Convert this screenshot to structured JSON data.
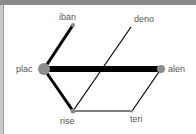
{
  "diagram": {
    "type": "network-graph",
    "nodes": [
      {
        "id": "iban",
        "label": "iban",
        "x": 73,
        "y": 25,
        "r": 2
      },
      {
        "id": "deno",
        "label": "deno",
        "x": 131,
        "y": 27,
        "r": 0
      },
      {
        "id": "plac",
        "label": "plac",
        "x": 44,
        "y": 69,
        "r": 6
      },
      {
        "id": "alen",
        "label": "alen",
        "x": 161,
        "y": 69,
        "r": 4
      },
      {
        "id": "rise",
        "label": "rise",
        "x": 73,
        "y": 111,
        "r": 2.5
      },
      {
        "id": "teri",
        "label": "teri",
        "x": 132,
        "y": 111,
        "r": 1.5
      }
    ],
    "edges": [
      {
        "from": "plac",
        "to": "alen",
        "width": 6
      },
      {
        "from": "plac",
        "to": "iban",
        "width": 3
      },
      {
        "from": "plac",
        "to": "rise",
        "width": 3
      },
      {
        "from": "rise",
        "to": "deno",
        "width": 1.2
      },
      {
        "from": "rise",
        "to": "teri",
        "width": 1.2
      },
      {
        "from": "teri",
        "to": "alen",
        "width": 1.2
      }
    ],
    "colors": {
      "node": "#8c8c8c",
      "edge": "#000000",
      "label": "#555555"
    }
  }
}
